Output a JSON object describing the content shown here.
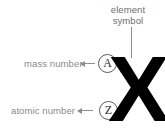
{
  "diagram": {
    "type": "atomic-notation-callout",
    "background_color": "#ffffff",
    "annotations": {
      "element_symbol": {
        "label_line_1": "element",
        "label_line_2": "symbol",
        "text_color": "#6e6e6e",
        "leader": "vertical-line"
      },
      "mass_number": {
        "label": "mass number",
        "text_color": "#8a8a8a",
        "arrow": "left-arrow",
        "token": "A"
      },
      "atomic_number": {
        "label": "atomic number",
        "text_color": "#8a8a8a",
        "arrow": "left-arrow",
        "token": "Z"
      }
    },
    "symbol": {
      "glyph": "X",
      "color": "#000000"
    },
    "line_color": "#8e8e8e",
    "circle_stroke_color": "#5d5d5d"
  }
}
